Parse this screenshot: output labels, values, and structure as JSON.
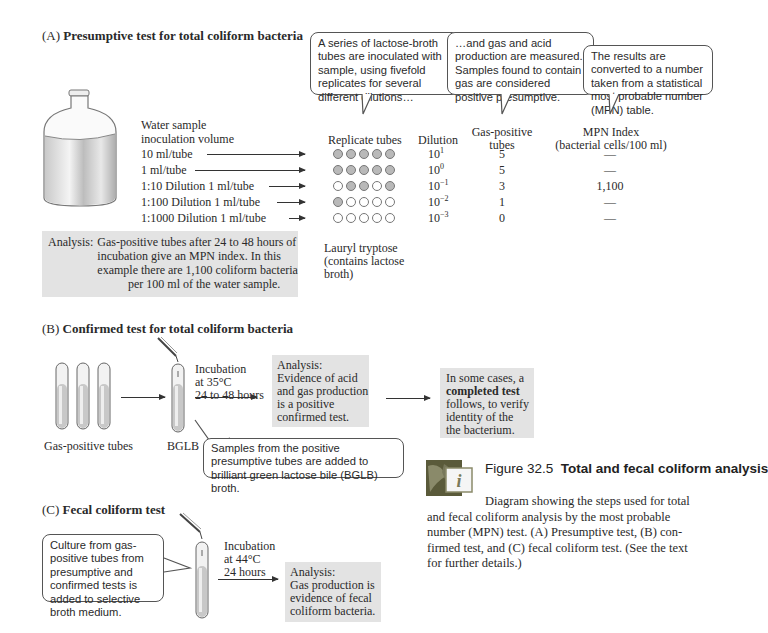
{
  "figure": {
    "number_label": "Figure 32.5",
    "title": "Total and fecal coliform analysis",
    "caption": "Diagram showing the steps used for total and fecal coliform analysis by the most probable number (MPN) test. (A) Presumptive test, (B) confirmed test, and (C) fecal coliform test. (See the text for further details.)",
    "caption_lines": [
      "Diagram showing the steps used for total",
      "and fecal coliform analysis by the most probable",
      "number (MPN) test. (A) Presumptive test, (B) con-",
      "firmed test, and (C) fecal coliform test. (See the text",
      "for further details.)"
    ],
    "icon": "interactive-info-icon"
  },
  "section_a": {
    "letter": "(A)",
    "title": "Presumptive test for total coliform bacteria",
    "callouts": [
      "A series of lactose-broth tubes are inoculated with sample, using fivefold replicates for several different dilutions…",
      "…and gas and acid production are measured. Samples found to contain gas are considered positive presumptive.",
      "The results are converted to a number taken from a statistical most probable number (MPN) table."
    ],
    "headers": {
      "volume_line1": "Water sample",
      "volume_line2": "inoculation volume",
      "replicates": "Replicate tubes",
      "dilution": "Dilution",
      "gas_line1": "Gas-positive",
      "gas_line2": "tubes",
      "mpn_line1": "MPN Index",
      "mpn_line2": "(bacterial cells/100 ml)"
    },
    "rows": [
      {
        "volume": "10 ml/tube",
        "tubes": [
          1,
          1,
          1,
          1,
          1
        ],
        "dilution_base": "10",
        "dilution_exp": "1",
        "gas_positive": "5",
        "mpn": "—"
      },
      {
        "volume": "1 ml/tube",
        "tubes": [
          1,
          1,
          1,
          1,
          1
        ],
        "dilution_base": "10",
        "dilution_exp": "0",
        "gas_positive": "5",
        "mpn": "—"
      },
      {
        "volume": "1:10 Dilution 1 ml/tube",
        "tubes": [
          0,
          1,
          1,
          0,
          1
        ],
        "dilution_base": "10",
        "dilution_exp": "−1",
        "gas_positive": "3",
        "mpn": "1,100"
      },
      {
        "volume": "1:100 Dilution 1 ml/tube",
        "tubes": [
          1,
          0,
          0,
          0,
          0
        ],
        "dilution_base": "10",
        "dilution_exp": "−2",
        "gas_positive": "1",
        "mpn": "—"
      },
      {
        "volume": "1:1000 Dilution 1 ml/tube",
        "tubes": [
          0,
          0,
          0,
          0,
          0
        ],
        "dilution_base": "10",
        "dilution_exp": "−3",
        "gas_positive": "0",
        "mpn": "—"
      }
    ],
    "medium_label_lines": [
      "Lauryl tryptose",
      "(contains lactose",
      "broth)"
    ],
    "analysis_label": "Analysis:",
    "analysis_lines": [
      "Gas-positive tubes after 24 to 48 hours of",
      "incubation give an MPN index. In this",
      "example there are 1,100 coliform bacteria",
      "per 100 ml of the water sample."
    ]
  },
  "section_b": {
    "letter": "(B)",
    "title": "Confirmed test for total coliform bacteria",
    "tubes_label": "Gas-positive tubes",
    "bglb_label": "BGLB",
    "incubation_lines": [
      "Incubation",
      "at 35°C",
      "24 to 48 hours"
    ],
    "analysis_lines": [
      "Analysis:",
      "Evidence of acid",
      "and gas production",
      "is a positive",
      "confirmed test."
    ],
    "completed_lines_pre": "In some cases, a",
    "completed_bold": "completed test",
    "completed_lines_post": [
      "follows, to verify",
      "identity of the",
      "the bacterium."
    ],
    "callout": "Samples from the positive presumptive tubes are added to brilliant green lactose bile (BGLB) broth."
  },
  "section_c": {
    "letter": "(C)",
    "title": "Fecal coliform test",
    "callout": "Culture from gas-positive tubes from presumptive and confirmed tests is added to selective broth medium.",
    "incubation_lines": [
      "Incubation",
      "at 44°C",
      "24 hours"
    ],
    "analysis_lines": [
      "Analysis:",
      "Gas production is",
      "evidence of fecal",
      "coliform bacteria."
    ]
  },
  "colors": {
    "gray_box": "#e3e3e3",
    "positive_tube": "#b9b9b9",
    "text": "#2a2a2a"
  }
}
